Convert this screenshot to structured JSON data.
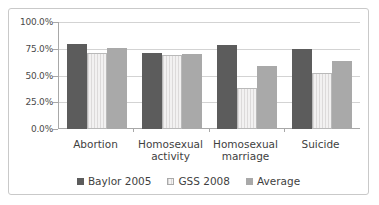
{
  "chart_data": {
    "type": "bar",
    "title": "",
    "xlabel": "",
    "ylabel": "",
    "ylim": [
      0,
      100
    ],
    "ytick_labels": [
      "100.0%",
      "75.0%",
      "50.0%",
      "25.0%",
      "0.0%"
    ],
    "ytick_values": [
      100,
      75,
      50,
      25,
      0
    ],
    "grid": true,
    "legend_position": "bottom",
    "categories": [
      "Abortion",
      "Homosexual activity",
      "Homosexual marriage",
      "Suicide"
    ],
    "category_lines": [
      [
        "Abortion"
      ],
      [
        "Homosexual",
        "activity"
      ],
      [
        "Homosexual",
        "marriage"
      ],
      [
        "Suicide"
      ]
    ],
    "series": [
      {
        "name": "Baylor 2005",
        "color": "#5c5c5c",
        "values": [
          80,
          72,
          79,
          75.5
        ]
      },
      {
        "name": "GSS 2008",
        "color": "#eceaea",
        "values": [
          72,
          70,
          39,
          53
        ]
      },
      {
        "name": "Average",
        "color": "#a9a9a9",
        "values": [
          76,
          71,
          59,
          64
        ]
      }
    ]
  }
}
